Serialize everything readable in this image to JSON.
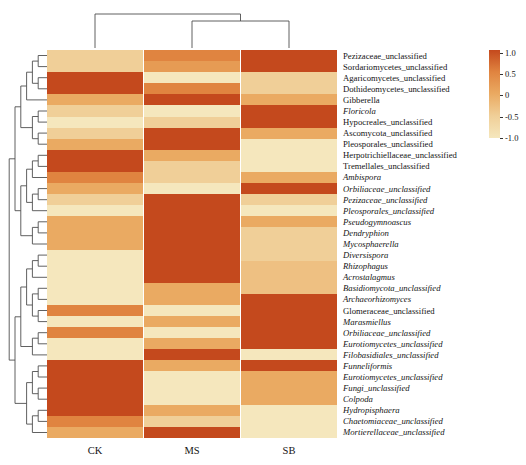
{
  "chart_data": {
    "type": "heatmap",
    "title": "",
    "columns": [
      "CK",
      "MS",
      "SB"
    ],
    "rows": [
      {
        "label": "Pezizaceae_unclassified",
        "italic": false,
        "values": [
          -0.5,
          0.5,
          1
        ]
      },
      {
        "label": "Sordariomycetes_unclassified",
        "italic": false,
        "values": [
          -0.5,
          0.2,
          1
        ]
      },
      {
        "label": "Agaricomycetes_unclassified",
        "italic": false,
        "values": [
          1,
          -1,
          -0.5
        ]
      },
      {
        "label": "Dothideomycetes_unclassified",
        "italic": false,
        "values": [
          1,
          0.5,
          -0.5
        ]
      },
      {
        "label": "Gibberella",
        "italic": false,
        "values": [
          0,
          1,
          0
        ]
      },
      {
        "label": "Floricola",
        "italic": true,
        "values": [
          -0.5,
          -1,
          1
        ]
      },
      {
        "label": "Hypocreales_unclassified",
        "italic": false,
        "values": [
          -1,
          -0.5,
          1
        ]
      },
      {
        "label": "Ascomycota_unclassified",
        "italic": false,
        "values": [
          -0.5,
          1,
          0
        ]
      },
      {
        "label": "Pleosporales_unclassified",
        "italic": false,
        "values": [
          0,
          1,
          -1
        ]
      },
      {
        "label": "Herpotrichiellaceae_unclassified",
        "italic": false,
        "values": [
          1,
          0,
          -1
        ]
      },
      {
        "label": "Tremellales_unclassified",
        "italic": false,
        "values": [
          1,
          -0.5,
          -1
        ]
      },
      {
        "label": "Ambispora",
        "italic": true,
        "values": [
          0.5,
          -0.5,
          0
        ]
      },
      {
        "label": "Orbiliaceae_unclassified",
        "italic": true,
        "values": [
          0,
          -1,
          1
        ]
      },
      {
        "label": "Pezizaceae_unclassified",
        "italic": true,
        "values": [
          -0.5,
          1,
          -0.5
        ]
      },
      {
        "label": "Pleosporales_unclassified",
        "italic": true,
        "values": [
          -1,
          1,
          -1
        ]
      },
      {
        "label": "Pseudogymnoascus",
        "italic": true,
        "values": [
          0,
          1,
          0
        ]
      },
      {
        "label": "Dendryphion",
        "italic": true,
        "values": [
          0,
          1,
          -0.5
        ]
      },
      {
        "label": "Mycosphaerella",
        "italic": true,
        "values": [
          0,
          1,
          -0.5
        ]
      },
      {
        "label": "Diversispora",
        "italic": true,
        "values": [
          -1,
          1,
          -0.5
        ]
      },
      {
        "label": "Rhizophagus",
        "italic": true,
        "values": [
          -1,
          1,
          -0.3
        ]
      },
      {
        "label": "Acrostalagmus",
        "italic": true,
        "values": [
          -1,
          1,
          -0.3
        ]
      },
      {
        "label": "Basidiomycota_unclassified",
        "italic": true,
        "values": [
          -1,
          0,
          -0.3
        ]
      },
      {
        "label": "Archaeorhizomyces",
        "italic": true,
        "values": [
          -1,
          0,
          1
        ]
      },
      {
        "label": "Glomeraceae_unclassified",
        "italic": false,
        "values": [
          0.5,
          -1,
          1
        ]
      },
      {
        "label": "Marasmiellus",
        "italic": true,
        "values": [
          -1,
          0,
          1
        ]
      },
      {
        "label": "Orbiliaceae_unclassified",
        "italic": true,
        "values": [
          0.5,
          -1,
          1
        ]
      },
      {
        "label": "Eurotiomycetes_unclassified",
        "italic": true,
        "values": [
          -1,
          0,
          1
        ]
      },
      {
        "label": "Filobasidiales_unclassified",
        "italic": true,
        "values": [
          -1,
          1,
          -1
        ]
      },
      {
        "label": "Funneliformis",
        "italic": true,
        "values": [
          1,
          0,
          1
        ]
      },
      {
        "label": "Eurotiomycetes_unclassified",
        "italic": true,
        "values": [
          1,
          -1,
          0
        ]
      },
      {
        "label": "Fungi_unclassified",
        "italic": true,
        "values": [
          1,
          -1,
          0
        ]
      },
      {
        "label": "Colpoda",
        "italic": true,
        "values": [
          1,
          -1,
          0
        ]
      },
      {
        "label": "Hydropisphaera",
        "italic": true,
        "values": [
          1,
          0,
          -1
        ]
      },
      {
        "label": "Chaetomiaceae_unclassified",
        "italic": true,
        "values": [
          0.5,
          -0.5,
          -1
        ]
      },
      {
        "label": "Mortierellaceae_unclassified",
        "italic": true,
        "values": [
          0,
          1,
          -1
        ]
      }
    ],
    "color_scale": {
      "stops": [
        {
          "value": 1.0,
          "color": "#c4491d"
        },
        {
          "value": 0.5,
          "color": "#e08440"
        },
        {
          "value": 0.0,
          "color": "#eaaa62"
        },
        {
          "value": -0.5,
          "color": "#f0cf98"
        },
        {
          "value": -1.0,
          "color": "#f5e7bd"
        }
      ]
    },
    "legend": {
      "tick_labels": [
        "1.0",
        "0.5",
        "0",
        "-0.5",
        "-1.0"
      ],
      "position": "right"
    },
    "clustering": {
      "column_tree": [
        "CK",
        [
          "MS",
          "SB"
        ]
      ],
      "row_tree": [
        [
          [
            [
              [
                [
                  1,
                  2
                ],
                [
                  3,
                  4
                ]
              ],
              5
            ],
            [
              [
                6,
                7
              ],
              [
                8,
                9
              ]
            ]
          ],
          [
            [
              [
                [
                  10,
                  11
                ],
                12
              ],
              [
                [
                  13,
                  14
                ],
                15
              ]
            ],
            [
              [
                16,
                17
              ],
              18
            ]
          ]
        ],
        [
          [
            [
              [
                [
                  19,
                  20
                ],
                21
              ],
              [
                [
                  22,
                  23
                ],
                [
                  24,
                  25
                ]
              ]
            ],
            [
              [
                26,
                27
              ],
              28
            ]
          ],
          [
            [
              [
                29,
                30
              ],
              [
                31,
                32
              ]
            ],
            [
              [
                33,
                34
              ],
              35
            ]
          ]
        ]
      ],
      "line_color": "#4f4f4f"
    }
  }
}
